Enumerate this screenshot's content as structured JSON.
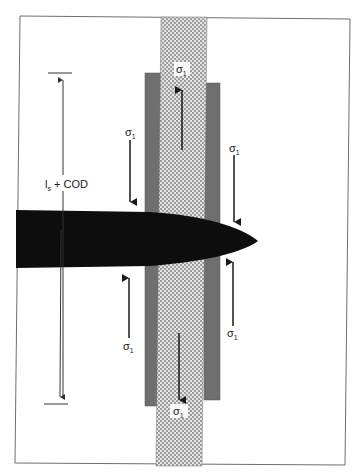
{
  "diagram": {
    "colors": {
      "background": "#ffffff",
      "frame": "#6e6e6e",
      "crack": "#0d0d0d",
      "bridge_bars": "#6f6f6f",
      "hatched_column_light": "#e6e6e6",
      "hatched_column_dark": "#9a9a9a",
      "arrow": "#1a1a1a"
    },
    "labels": {
      "dimension": "l",
      "dimension_sub": "s",
      "dimension_rest": " + COD",
      "sigma_top_center": "σ",
      "sigma_top_center_sub": "1",
      "sigma_upper_left": "σ",
      "sigma_upper_left_sub": "1",
      "sigma_upper_right": "σ",
      "sigma_upper_right_sub": "1",
      "sigma_lower_left": "σ",
      "sigma_lower_left_sub": "1",
      "sigma_lower_right": "σ",
      "sigma_lower_right_sub": "1",
      "sigma_bottom_center": "σ",
      "sigma_bottom_center_sub": "1"
    }
  }
}
